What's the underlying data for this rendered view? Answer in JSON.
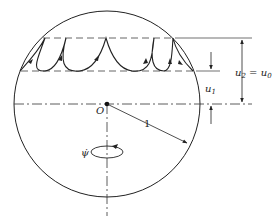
{
  "diagram": {
    "labels": {
      "center": "O",
      "radius": "1",
      "upper_level": "u",
      "upper_sub": "2",
      "upper_eq": "= u",
      "upper_eq_sub": "0",
      "lower_level": "u",
      "lower_sub": "1",
      "precession_rate": "ψ̇"
    },
    "colors": {
      "stroke": "#222222",
      "background": "#ffffff"
    }
  }
}
